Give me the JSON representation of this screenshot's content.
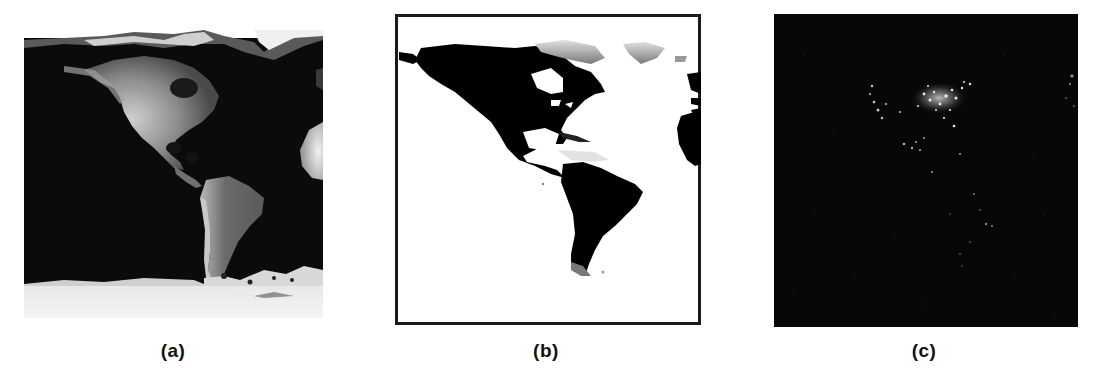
{
  "figure": {
    "panels": [
      {
        "id": "a",
        "caption": "(a)",
        "description": "Earth surface reflectance with clouds and polar ice (Americas view)",
        "colors": {
          "ocean": "#0a0a0a",
          "land": "#6e6e6e",
          "land_bright": "#c8c8c8",
          "ice": "#eeeeee"
        }
      },
      {
        "id": "b",
        "caption": "(b)",
        "description": "Land/water mask (land black, water white) with frame",
        "colors": {
          "land": "#000000",
          "water": "#ffffff",
          "frame": "#1a1a1a",
          "ice_tint": "#9a9a9a"
        }
      },
      {
        "id": "c",
        "caption": "(c)",
        "description": "Night lights over the Americas",
        "colors": {
          "background": "#050505",
          "lights": "#e6e6e6"
        }
      }
    ]
  }
}
